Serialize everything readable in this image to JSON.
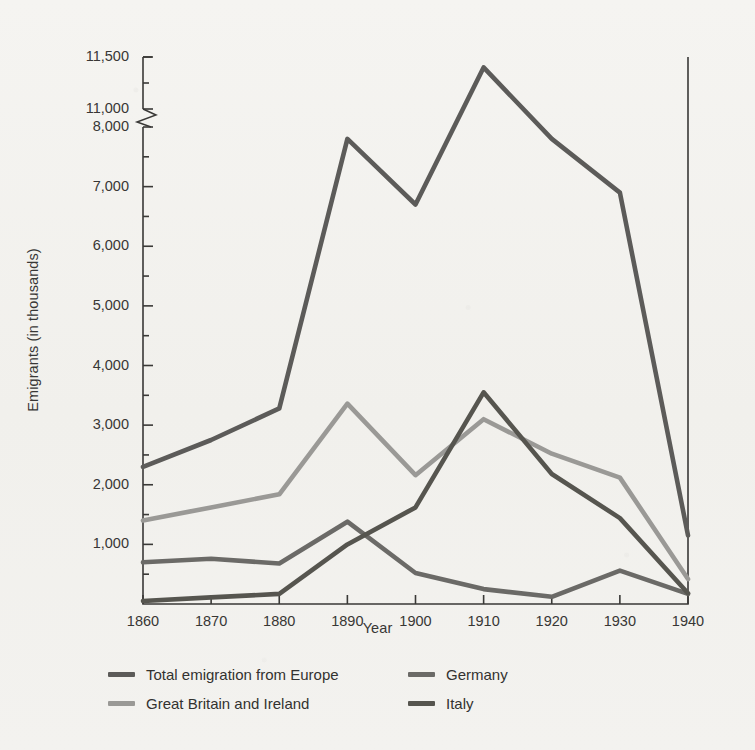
{
  "chart_data": {
    "type": "line",
    "title": "",
    "xlabel": "Year",
    "ylabel": "Emigrants (in thousands)",
    "x": [
      1860,
      1870,
      1880,
      1890,
      1900,
      1910,
      1920,
      1930,
      1940
    ],
    "xtick_labels": [
      "1860",
      "1870",
      "1880",
      "1890",
      "1900",
      "1910",
      "1920",
      "1930",
      "1940"
    ],
    "ytick_labels": [
      "1,000",
      "2,000",
      "3,000",
      "4,000",
      "5,000",
      "6,000",
      "7,000",
      "8,000",
      "11,000",
      "11,500"
    ],
    "ytick_values": [
      1000,
      2000,
      3000,
      4000,
      5000,
      6000,
      7000,
      8000,
      11000,
      11500
    ],
    "yminor_values": [
      500,
      1500,
      2500,
      3500,
      4500,
      5500,
      6500,
      7500,
      11250
    ],
    "ylim": [
      0,
      11500
    ],
    "axis_break": {
      "present": true,
      "between": [
        8000,
        11000
      ],
      "label": "scale break"
    },
    "grid": false,
    "legend_position": "below-axes",
    "series": [
      {
        "name": "Total emigration from Europe",
        "color": "#5c5b59",
        "values": [
          2300,
          2750,
          3280,
          7800,
          6700,
          11400,
          7800,
          6900,
          1150
        ]
      },
      {
        "name": "Great Britain and Ireland",
        "color": "#9a9996",
        "values": [
          1400,
          1620,
          1840,
          3360,
          2160,
          3100,
          2520,
          2120,
          420
        ]
      },
      {
        "name": "Germany",
        "color": "#6b6a67",
        "values": [
          700,
          760,
          680,
          1380,
          520,
          250,
          120,
          560,
          170
        ]
      },
      {
        "name": "Italy",
        "color": "#56554f",
        "values": [
          50,
          110,
          170,
          1000,
          1620,
          3550,
          2180,
          1440,
          180
        ]
      }
    ]
  },
  "legend": {
    "entries": [
      {
        "label": "Total emigration from Europe",
        "color": "#5c5b59"
      },
      {
        "label": "Germany",
        "color": "#6b6a67"
      },
      {
        "label": "Great Britain and Ireland",
        "color": "#9a9996"
      },
      {
        "label": "Italy",
        "color": "#56554f"
      }
    ]
  },
  "style": {
    "background": "#f2f1ee",
    "axis_color": "#3a3937",
    "text_color": "#333230"
  }
}
